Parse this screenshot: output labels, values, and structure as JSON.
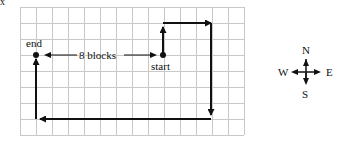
{
  "figure": {
    "corner_mark": "x",
    "grid": {
      "columns": 14,
      "rows": 8,
      "line_color": "#c8c8c8"
    },
    "labels": {
      "end": "end",
      "start": "start",
      "distance": "8 blocks"
    },
    "path": {
      "description": "Start → N 2 blocks → E 3 blocks → S 6 blocks → W 12 blocks → N 5 blocks → End",
      "segments": [
        {
          "direction": "N",
          "blocks": 2
        },
        {
          "direction": "E",
          "blocks": 3
        },
        {
          "direction": "S",
          "blocks": 6
        },
        {
          "direction": "W",
          "blocks": 12
        },
        {
          "direction": "N",
          "blocks": 5
        }
      ],
      "color": "#111111"
    },
    "compass": {
      "north": "N",
      "south": "S",
      "east": "E",
      "west": "W"
    }
  }
}
